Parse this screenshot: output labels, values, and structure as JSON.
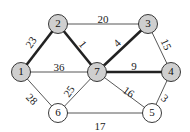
{
  "diagram": {
    "type": "weighted-graph",
    "colors": {
      "shaded_node_fill": "#cfcfcf",
      "plain_node_fill": "#ffffff",
      "stroke": "#222222",
      "thin_edge": "#444444"
    },
    "nodes": [
      {
        "id": "1",
        "label": "1",
        "x": 21,
        "y": 72,
        "shaded": true
      },
      {
        "id": "2",
        "label": "2",
        "x": 58,
        "y": 24,
        "shaded": true
      },
      {
        "id": "3",
        "label": "3",
        "x": 148,
        "y": 24,
        "shaded": true
      },
      {
        "id": "4",
        "label": "4",
        "x": 171,
        "y": 72,
        "shaded": true
      },
      {
        "id": "5",
        "label": "5",
        "x": 152,
        "y": 113,
        "shaded": false
      },
      {
        "id": "6",
        "label": "6",
        "x": 58,
        "y": 113,
        "shaded": false
      },
      {
        "id": "7",
        "label": "7",
        "x": 97,
        "y": 72,
        "shaded": true
      }
    ],
    "edges": [
      {
        "from": "1",
        "to": "2",
        "weight": "23",
        "bold": true,
        "lx": 32,
        "ly": 43,
        "rot": -55
      },
      {
        "from": "2",
        "to": "7",
        "weight": "1",
        "bold": true,
        "lx": 82,
        "ly": 45,
        "rot": 50
      },
      {
        "from": "2",
        "to": "3",
        "weight": "20",
        "bold": false,
        "lx": 103,
        "ly": 20,
        "rot": 0
      },
      {
        "from": "3",
        "to": "7",
        "weight": "4",
        "bold": true,
        "lx": 118,
        "ly": 44,
        "rot": -45
      },
      {
        "from": "3",
        "to": "4",
        "weight": "15",
        "bold": false,
        "lx": 165,
        "ly": 45,
        "rot": 65
      },
      {
        "from": "1",
        "to": "7",
        "weight": "36",
        "bold": false,
        "lx": 59,
        "ly": 68,
        "rot": 0
      },
      {
        "from": "7",
        "to": "4",
        "weight": "9",
        "bold": true,
        "lx": 134,
        "ly": 67,
        "rot": 0
      },
      {
        "from": "1",
        "to": "6",
        "weight": "28",
        "bold": false,
        "lx": 31,
        "ly": 100,
        "rot": 45
      },
      {
        "from": "6",
        "to": "7",
        "weight": "25",
        "bold": false,
        "lx": 70,
        "ly": 92,
        "rot": -55
      },
      {
        "from": "7",
        "to": "5",
        "weight": "16",
        "bold": false,
        "lx": 128,
        "ly": 93,
        "rot": 35
      },
      {
        "from": "4",
        "to": "5",
        "weight": "3",
        "bold": false,
        "lx": 164,
        "ly": 99,
        "rot": 40
      },
      {
        "from": "6",
        "to": "5",
        "weight": "17",
        "bold": false,
        "lx": 100,
        "ly": 127,
        "rot": 0
      }
    ]
  }
}
